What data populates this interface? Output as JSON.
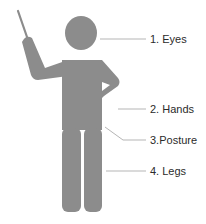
{
  "diagram": {
    "figure": "presenter-with-pointer",
    "figure_color": "#8c8c8c",
    "line_color": "#b5b5b5",
    "labels": [
      {
        "id": "eyes",
        "text": "1. Eyes"
      },
      {
        "id": "hands",
        "text": "2. Hands"
      },
      {
        "id": "posture",
        "text": "3.Posture"
      },
      {
        "id": "legs",
        "text": "4. Legs"
      }
    ]
  }
}
